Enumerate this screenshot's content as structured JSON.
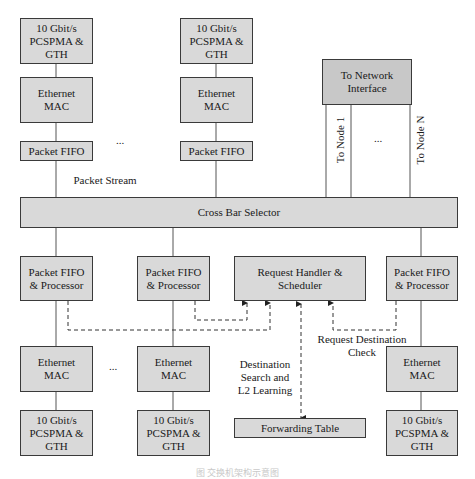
{
  "top_row": {
    "col1": {
      "phy": "10 Gbit/s\nPCSPMA &\nGTH",
      "mac": "Ethernet\nMAC",
      "fifo": "Packet FIFO"
    },
    "col2": {
      "phy": "10 Gbit/s\nPCSPMA &\nGTH",
      "mac": "Ethernet\nMAC",
      "fifo": "Packet FIFO"
    },
    "ellipsis": "...",
    "packet_stream_label": "Packet Stream"
  },
  "network": {
    "box": "To Network\nInterface",
    "node_first": "To Node 1",
    "node_last": "To Node N",
    "ellipsis": "..."
  },
  "crossbar": {
    "label": "Cross Bar Selector"
  },
  "bottom_row": {
    "col1": {
      "fifo": "Packet FIFO\n& Processor",
      "mac": "Ethernet\nMAC",
      "phy": "10 Gbit/s\nPCSPMA &\nGTH"
    },
    "col2": {
      "fifo": "Packet FIFO\n& Processor",
      "mac": "Ethernet\nMAC",
      "phy": "10 Gbit/s\nPCSPMA &\nGTH"
    },
    "col4": {
      "fifo": "Packet FIFO\n& Processor",
      "mac": "Ethernet\nMAC",
      "phy": "10 Gbit/s\nPCSPMA &\nGTH"
    },
    "ellipsis": "..."
  },
  "scheduler": {
    "box": "Request Handler &\nScheduler",
    "forwarding_table": "Forwarding Table",
    "search_label": "Destination\nSearch and\nL2 Learning",
    "check_label": "Request Destination\nCheck"
  },
  "caption": "图  交换机架构示意图"
}
